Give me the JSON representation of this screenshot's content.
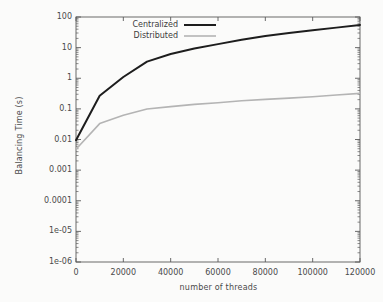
{
  "chart_data": {
    "type": "line",
    "title": "",
    "xlabel": "number of threads",
    "ylabel": "Balancing Time (s)",
    "xlim": [
      0,
      120000
    ],
    "ylim": [
      1e-06,
      100
    ],
    "yscale": "log",
    "xscale": "linear",
    "grid": false,
    "legend_position": "top-left-inside",
    "x_ticks": [
      0,
      20000,
      40000,
      60000,
      80000,
      100000,
      120000
    ],
    "x_tick_labels": [
      "0",
      "20000",
      "40000",
      "60000",
      "80000",
      "100000",
      "120000"
    ],
    "y_ticks": [
      1e-06,
      1e-05,
      0.0001,
      0.001,
      0.01,
      0.1,
      1,
      10,
      100
    ],
    "y_tick_labels": [
      "1e-06",
      "1e-05",
      "0.0001",
      "0.001",
      "0.01",
      "0.1",
      "1",
      "10",
      "100"
    ],
    "x": [
      0,
      10000,
      20000,
      30000,
      40000,
      50000,
      60000,
      70000,
      80000,
      90000,
      100000,
      110000,
      120000
    ],
    "series": [
      {
        "name": "Centralized",
        "color": "#1d1d1d",
        "width": 2.0,
        "values": [
          0.0095,
          0.27,
          1.1,
          3.5,
          6.2,
          9.3,
          13.0,
          18.0,
          24.0,
          30.0,
          37.0,
          45.0,
          55.0
        ]
      },
      {
        "name": "Distributed",
        "color": "#b4b4b4",
        "width": 1.6,
        "values": [
          0.0048,
          0.033,
          0.062,
          0.099,
          0.118,
          0.14,
          0.158,
          0.185,
          0.205,
          0.225,
          0.25,
          0.285,
          0.32
        ]
      }
    ]
  },
  "legend": {
    "entries": [
      {
        "label": "Centralized"
      },
      {
        "label": "Distributed"
      }
    ]
  },
  "colors": {
    "background": "#fbfbfa",
    "axis": "#5a5a5a",
    "text": "#4a4a4a",
    "centralized": "#1d1d1d",
    "distributed": "#b4b4b4"
  }
}
